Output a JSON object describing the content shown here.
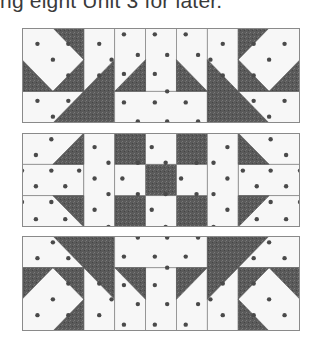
{
  "caption": "ng eight Unit 3 for later.",
  "colors": {
    "light": "#f7f7f7",
    "dark": "#5a5a5a",
    "outline": "#8a8a8a",
    "dot": "#4a4a4a",
    "text": "#3a3a3a"
  },
  "figure": {
    "panels": [
      {
        "name": "row-1",
        "top": 28,
        "height": 95,
        "blocks": [
          {
            "type": "diamond-corner",
            "flipX": false,
            "flipY": false
          },
          {
            "type": "bars-bottom",
            "flipX": false,
            "flipY": false
          },
          {
            "type": "diamond-corner",
            "flipX": true,
            "flipY": false
          }
        ]
      },
      {
        "name": "row-2",
        "top": 133,
        "height": 94,
        "blocks": [
          {
            "type": "flying-geese-side",
            "flipX": false,
            "flipY": false
          },
          {
            "type": "nine-patch",
            "flipX": false,
            "flipY": false
          },
          {
            "type": "flying-geese-side",
            "flipX": true,
            "flipY": false
          }
        ]
      },
      {
        "name": "row-3",
        "top": 236,
        "height": 95,
        "blocks": [
          {
            "type": "diamond-corner",
            "flipX": false,
            "flipY": true
          },
          {
            "type": "bars-bottom",
            "flipX": false,
            "flipY": true
          },
          {
            "type": "diamond-corner",
            "flipX": true,
            "flipY": true
          }
        ]
      }
    ]
  }
}
